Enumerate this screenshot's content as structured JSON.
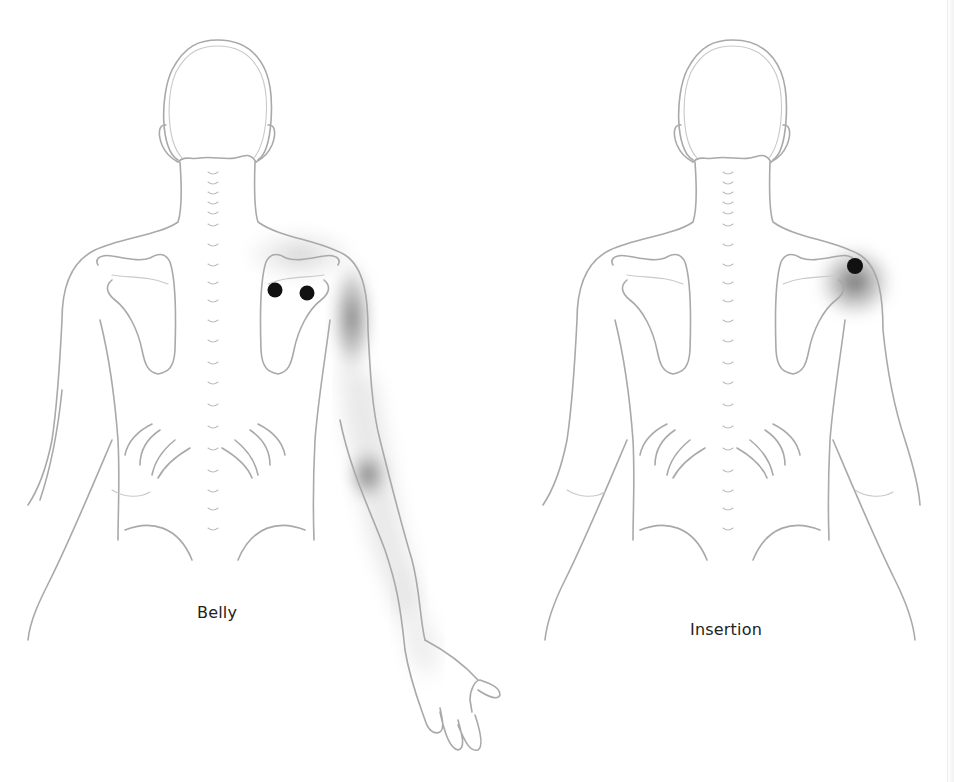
{
  "figures": [
    {
      "id": "belly",
      "label": "Belly",
      "trigger_points": [
        {
          "name": "trigger-point-1",
          "cx": 275,
          "cy": 290,
          "r": 7.5
        },
        {
          "name": "trigger-point-2",
          "cx": 307,
          "cy": 293,
          "r": 7.5
        }
      ],
      "referred_pain_zones": [
        "posterior-shoulder",
        "upper-arm",
        "elbow",
        "forearm"
      ]
    },
    {
      "id": "insertion",
      "label": "Insertion",
      "trigger_points": [
        {
          "name": "trigger-point-1",
          "cx": 855,
          "cy": 266,
          "r": 8
        }
      ],
      "referred_pain_zones": [
        "posterior-shoulder"
      ]
    }
  ],
  "colors": {
    "outline": "#a9a9a9",
    "trigger_point": "#111111",
    "pain_shade": "#6e6e6e",
    "label": "#222222"
  }
}
